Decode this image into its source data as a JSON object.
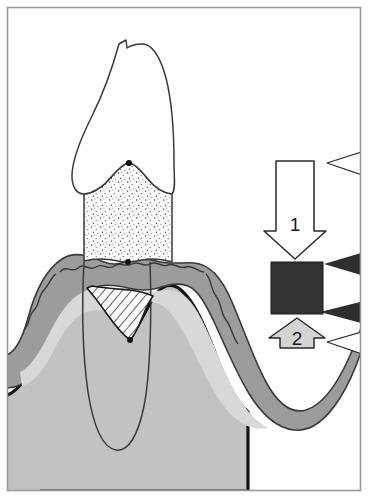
{
  "figure": {
    "background_color": "#ffffff",
    "border_color": "#9a9a9a",
    "width": 368,
    "height": 498
  },
  "colors": {
    "outline": "#1a1a1a",
    "thin_outline": "#3a3a3a",
    "border": "#9a9a9a",
    "enamel_fill": "#ffffff",
    "dentin_fill": "#fdfdfd",
    "dentin_stipple": "#4a4a4a",
    "gingiva_band": "#9c9c9c",
    "gingiva_inner": "#d8d8d8",
    "bone_fill": "#c2c2c2",
    "pocket_hatch": "#2a2a2a",
    "marker_dot": "#111111",
    "dark_block": "#333333",
    "gray_arrow_fill": "#d4d4d4",
    "white_arrow_fill": "#ffffff"
  },
  "legend": {
    "arrow_down": {
      "name": "arrow-down-1",
      "label": "1",
      "fill": "#ffffff",
      "direction": "down"
    },
    "block": {
      "name": "dark-block",
      "label": "",
      "fill": "#333333"
    },
    "arrow_up": {
      "name": "arrow-up-2",
      "label": "2",
      "fill": "#d4d4d4",
      "direction": "up"
    }
  },
  "pointers": [
    {
      "id": "pointer-1",
      "style": "outline",
      "fill": "#ffffff",
      "target": "arrow-down-1",
      "y": 163
    },
    {
      "id": "pointer-2",
      "style": "filled",
      "fill": "#2e2e2e",
      "target": "dark-block-top",
      "y": 264
    },
    {
      "id": "pointer-3",
      "style": "filled",
      "fill": "#2e2e2e",
      "target": "dark-block-bottom",
      "y": 312
    },
    {
      "id": "pointer-4",
      "style": "outline",
      "fill": "#ffffff",
      "target": "arrow-up-2",
      "y": 342
    }
  ],
  "anatomy": {
    "crown": {
      "name": "tooth-crown",
      "fill": "#ffffff"
    },
    "dentin": {
      "name": "tooth-dentin-root",
      "fill": "#fdfdfd",
      "texture": "stipple"
    },
    "gingiva": {
      "name": "gingiva",
      "fill": "#9c9c9c"
    },
    "gingiva_inner": {
      "name": "gingiva-inner",
      "fill": "#d8d8d8"
    },
    "bone": {
      "name": "alveolar-bone",
      "fill": "#c2c2c2"
    },
    "pocket": {
      "name": "periodontal-pocket",
      "texture": "hatch"
    },
    "markers": [
      {
        "name": "marker-cej",
        "x": 129,
        "y": 163
      },
      {
        "name": "marker-gingival-margin",
        "x": 128,
        "y": 262
      },
      {
        "name": "marker-pocket-base",
        "x": 130,
        "y": 340
      }
    ]
  }
}
